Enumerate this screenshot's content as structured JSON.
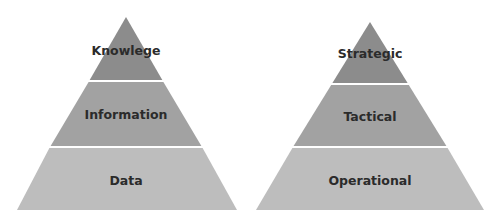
{
  "diagrams": [
    {
      "name": "knowledge-pyramid",
      "levels": [
        {
          "label": "Knowlege",
          "color": "#8c8c8c"
        },
        {
          "label": "Information",
          "color": "#a2a2a2"
        },
        {
          "label": "Data",
          "color": "#bdbdbd"
        }
      ]
    },
    {
      "name": "management-pyramid",
      "levels": [
        {
          "label": "Strategic",
          "color": "#8c8c8c"
        },
        {
          "label": "Tactical",
          "color": "#a2a2a2"
        },
        {
          "label": "Operational",
          "color": "#bdbdbd"
        }
      ]
    }
  ],
  "colors": {
    "top": "#8c8c8c",
    "middle": "#a2a2a2",
    "bottom": "#bdbdbd",
    "divider": "#ffffff",
    "text": "#2b2b2b"
  }
}
